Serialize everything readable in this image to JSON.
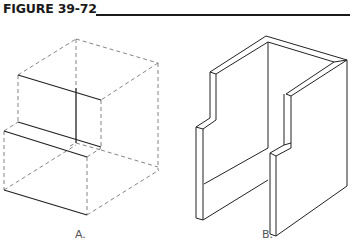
{
  "figure": {
    "title": "FIGURE 39-72",
    "colors": {
      "line": "#222222",
      "hidden_line": "#777777",
      "background": "#ffffff"
    }
  },
  "views": [
    {
      "id": "A",
      "label": "A.",
      "description": "Isometric box with dashed hidden lines and solid visible edges of a stepped profile"
    },
    {
      "id": "B",
      "label": "B.",
      "description": "Isometric solid of two-walled open box with stepped notches"
    }
  ]
}
